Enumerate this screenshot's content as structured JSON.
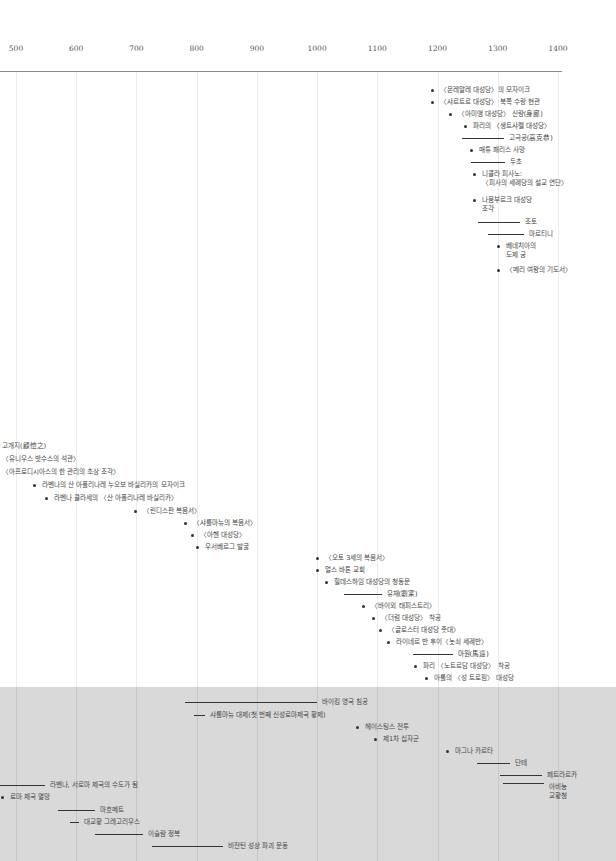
{
  "chart_data": {
    "type": "timeline",
    "title": "",
    "xlabel": "",
    "ylabel": "",
    "x_range": [
      500,
      1400
    ],
    "ticks": [
      "500",
      "600",
      "700",
      "800",
      "900",
      "1000",
      "1100",
      "1200",
      "1300",
      "1400"
    ],
    "grid": true,
    "sections": [
      {
        "name": "art-works-upper",
        "shaded": false,
        "events": [
          {
            "kind": "point",
            "year": 1190,
            "label": "〈몬레알레 대성당〉의 모자이크"
          },
          {
            "kind": "point",
            "year": 1190,
            "label": "〈샤르트르 대성당〉 북쪽 수랑 현관"
          },
          {
            "kind": "point",
            "year": 1220,
            "label": "〈아미앵 대성당〉 신랑(身廊)"
          },
          {
            "kind": "point",
            "year": 1245,
            "label": "파리의 〈생트샤펠 대성당〉"
          },
          {
            "kind": "span",
            "start": 1240,
            "end": 1310,
            "label": "고극공(高克恭)"
          },
          {
            "kind": "point",
            "year": 1255,
            "label": "매튜 패리스 사망"
          },
          {
            "kind": "span",
            "start": 1255,
            "end": 1312,
            "label": "두초"
          },
          {
            "kind": "point",
            "year": 1260,
            "label": [
              "니콜라 피사노:",
              "〈피사의 세례당의 설교 연단〉"
            ]
          },
          {
            "kind": "point",
            "year": 1260,
            "label": [
              "나움부르크 대성당",
              "조각"
            ]
          },
          {
            "kind": "span",
            "start": 1267,
            "end": 1337,
            "label": "조토"
          },
          {
            "kind": "span",
            "start": 1284,
            "end": 1344,
            "label": "마르티니"
          },
          {
            "kind": "point",
            "year": 1300,
            "label": [
              "베네치아의",
              "도제 궁"
            ]
          },
          {
            "kind": "point",
            "year": 1300,
            "label": "〈메리 여왕의 기도서〉"
          }
        ]
      },
      {
        "name": "art-works-lower",
        "shaded": false,
        "events": [
          {
            "kind": "text",
            "year": 500,
            "label": "고개지(顧愷之)"
          },
          {
            "kind": "text",
            "year": 500,
            "label": "〈유니우스 밧수스의 석관〉"
          },
          {
            "kind": "text",
            "year": 500,
            "label": "〈아프로디시아스의 한 관리의 초상 조각〉"
          },
          {
            "kind": "point",
            "year": 530,
            "label": "라벤나의 산 아폴리나레 누오보 바실리카의 모자이크"
          },
          {
            "kind": "point",
            "year": 549,
            "label": "라벤나 클라세의 〈산 아폴리나레 바실리카〉"
          },
          {
            "kind": "point",
            "year": 698,
            "label": "〈린디스판 복음서〉"
          },
          {
            "kind": "point",
            "year": 781,
            "label": "〈샤를마뉴의 복음서〉"
          },
          {
            "kind": "point",
            "year": 792,
            "label": "〈아헨 대성당〉"
          },
          {
            "kind": "point",
            "year": 800,
            "label": "우서베르그 발굴"
          },
          {
            "kind": "point",
            "year": 1000,
            "label": "〈오토 3세의 복음서〉"
          },
          {
            "kind": "point",
            "year": 1000,
            "label": "얼스 바톤 교회"
          },
          {
            "kind": "point",
            "year": 1015,
            "label": "힐데스하임 대성당의 청동문"
          },
          {
            "kind": "span",
            "start": 1045,
            "end": 1107,
            "label": "유채(劉寀)"
          },
          {
            "kind": "point",
            "year": 1077,
            "label": "〈바이외 태피스트리〉"
          },
          {
            "kind": "point",
            "year": 1093,
            "label": "〈더럼 대성당〉 착공"
          },
          {
            "kind": "point",
            "year": 1104,
            "label": "〈글로스터 대성당 촛대〉"
          },
          {
            "kind": "point",
            "year": 1118,
            "label": "라이네르 반 후이〈놋쇠 세례반〉"
          },
          {
            "kind": "span",
            "start": 1160,
            "end": 1225,
            "label": "마원(馬遠)"
          },
          {
            "kind": "point",
            "year": 1163,
            "label": "파리 〈노트르담 대성당〉 착공"
          },
          {
            "kind": "point",
            "year": 1180,
            "label": "아롤의 〈성 트로핌〉 대성당"
          }
        ]
      },
      {
        "name": "history",
        "shaded": true,
        "events": [
          {
            "kind": "span",
            "start": 780,
            "end": 1000,
            "label": "바이킹 영국 침공"
          },
          {
            "kind": "span",
            "start": 795,
            "end": 814,
            "label": "샤를마뉴 대제(첫 번째 신성로마제국 황제)"
          },
          {
            "kind": "point",
            "year": 1066,
            "label": "헤이스팅스 전투"
          },
          {
            "kind": "point",
            "year": 1096,
            "label": "제1차 십자군"
          },
          {
            "kind": "point",
            "year": 1215,
            "label": "마그나 카르타"
          },
          {
            "kind": "span",
            "start": 1265,
            "end": 1321,
            "label": "단테"
          },
          {
            "kind": "span",
            "start": 1304,
            "end": 1374,
            "label": "페트라르카"
          },
          {
            "kind": "span",
            "start": 1309,
            "end": 1377,
            "label": [
              "아비뇽",
              "교황청"
            ]
          },
          {
            "kind": "span",
            "start": 402,
            "end": 476,
            "label": "라벤나, 서로마 제국의 수도가 됨"
          },
          {
            "kind": "point",
            "year": 476,
            "label": "로마 제국 멸망"
          },
          {
            "kind": "span",
            "start": 570,
            "end": 632,
            "label": "마호메트"
          },
          {
            "kind": "span",
            "start": 590,
            "end": 604,
            "label": "대교황 그레고리우스"
          },
          {
            "kind": "span",
            "start": 632,
            "end": 711,
            "label": "이슬람 정복"
          },
          {
            "kind": "span",
            "start": 726,
            "end": 843,
            "label": "비잔틴 성상 파괴 운동"
          }
        ]
      }
    ]
  }
}
